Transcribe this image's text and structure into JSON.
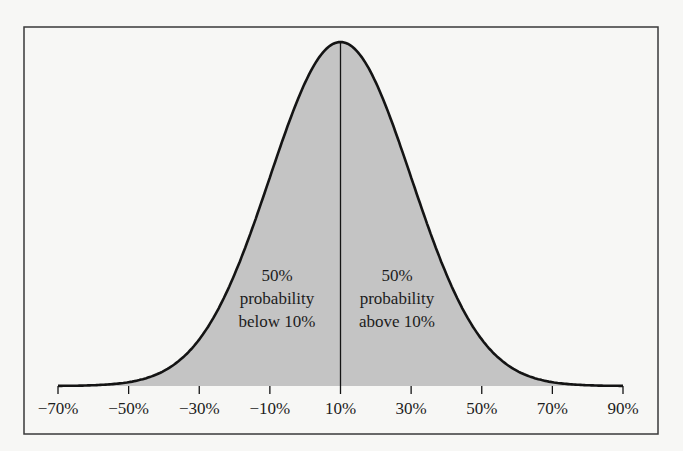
{
  "chart_data": {
    "type": "area",
    "title": "",
    "xlabel": "",
    "ylabel": "",
    "distribution": "normal",
    "mean": 10,
    "sd": 20,
    "x_ticks": [
      -70,
      -50,
      -30,
      -10,
      10,
      30,
      50,
      70,
      90
    ],
    "x_tick_labels": [
      "−70%",
      "−50%",
      "−30%",
      "−10%",
      "10%",
      "30%",
      "50%",
      "70%",
      "90%"
    ],
    "xlim": [
      -70,
      90
    ],
    "grid": false,
    "legend": null,
    "divider_at": 10,
    "annotations": [
      {
        "side": "left",
        "lines": [
          "50%",
          "probability",
          "below 10%"
        ]
      },
      {
        "side": "right",
        "lines": [
          "50%",
          "probability",
          "above 10%"
        ]
      }
    ],
    "colors": {
      "fill": "#c4c4c4",
      "curve": "#141414",
      "frame": "#3a3a3a",
      "background": "#f7f7f5"
    }
  }
}
